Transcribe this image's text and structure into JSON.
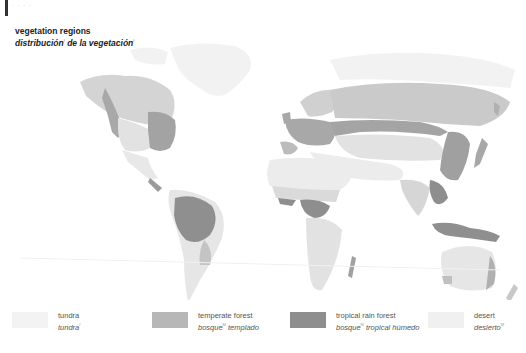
{
  "header": {
    "corner_marks": "· · · ·"
  },
  "title": {
    "en": "vegetation regions",
    "es_part1": "distribución",
    "es_sup1": "f",
    "es_part2": " de la vegetación",
    "es_sup2": "f"
  },
  "map": {
    "description": "world map of vegetation regions",
    "colors": {
      "ocean": "#ffffff",
      "tundra": "#f1f1f1",
      "temperate_forest": "#bdbdbd",
      "tropical_rain_forest": "#8f8f8f",
      "desert": "#ececec",
      "grassland": "#dcdcdc",
      "boreal": "#cfcfcf"
    }
  },
  "legend": {
    "items": [
      {
        "en": "tundra",
        "es": "tundra",
        "sup": "f",
        "es_rest": "",
        "color": "#f3f3f3"
      },
      {
        "en": "temperate forest",
        "es": "bosque",
        "sup": "M",
        "es_rest": " templado",
        "color": "#b7b7b7"
      },
      {
        "en": "tropical rain forest",
        "es": "bosque",
        "sup": "M",
        "es_rest": " tropical húmedo",
        "color": "#8e8e8e"
      },
      {
        "en": "desert",
        "es": "desierto",
        "sup": "M",
        "es_rest": "",
        "color": "#f0f0f0"
      }
    ]
  }
}
